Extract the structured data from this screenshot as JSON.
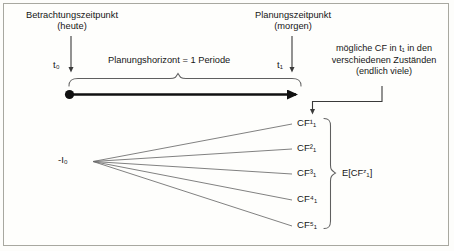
{
  "figure": {
    "title_left": "Betrachtungszeitpunkt",
    "subtitle_left": "(heute)",
    "title_right": "Planungszeitpunkt",
    "subtitle_right": "(morgen)",
    "horizon_label": "Planungshorizont = 1 Periode",
    "side_note_line1": "mögliche CF in t₁ in den",
    "side_note_line2": "verschiedenen Zuständen",
    "side_note_line3": "(endlich viele)",
    "time_start": "t₀",
    "time_end": "t₁",
    "investment_label": "-I₀",
    "expectation_label": "E[CFᶻ₁]",
    "expectation_base": "E[CF",
    "expectation_sup": "z",
    "expectation_sub": "1",
    "expectation_close": "]",
    "cash_flows": [
      {
        "base": "CF",
        "sup": "1",
        "sub": "1",
        "text": "CF¹₁"
      },
      {
        "base": "CF",
        "sup": "2",
        "sub": "1",
        "text": "CF²₁"
      },
      {
        "base": "CF",
        "sup": "3",
        "sub": "1",
        "text": "CF³₁"
      },
      {
        "base": "CF",
        "sup": "4",
        "sub": "1",
        "text": "CF⁴₁"
      },
      {
        "base": "CF",
        "sup": "5",
        "sub": "1",
        "text": "CF⁵₁"
      }
    ],
    "colors": {
      "background": "#fdfdfb",
      "frame_border": "#a8a8a0",
      "text": "#161616",
      "timeline": "#111111",
      "fan_line": "#6a6a6a",
      "brace": "#5f5f5f",
      "arrow": "#3a3a3a"
    }
  }
}
